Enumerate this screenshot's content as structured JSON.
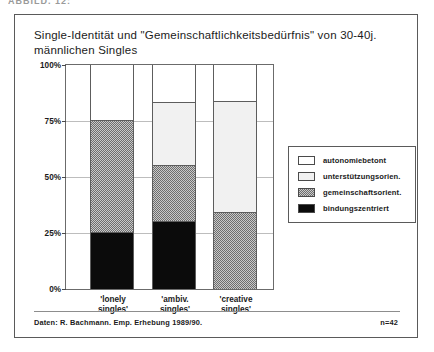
{
  "top_caption": "ABBILD. 12:",
  "figure": {
    "title": "Single-Identität und \"Gemeinschaftlichkeitsbedürfnis\"\nvon 30-40j. männlichen Singles",
    "source_note": "Daten: R. Bachmann. Emp. Erhebung 1989/90.",
    "n_note": "n=42"
  },
  "legend": {
    "items": [
      {
        "label": "autonomiebetont",
        "key": "autonomiebetont",
        "color": "#ffffff"
      },
      {
        "label": "unterstützungsorien.",
        "key": "unterstuetzung",
        "color": "#f1f1f1"
      },
      {
        "label": "gemeinschaftsorient.",
        "key": "gemeinschaft",
        "color": "#8f8f8f"
      },
      {
        "label": "bindungszentriert",
        "key": "bindung",
        "color": "#0b0b0b"
      }
    ]
  },
  "chart_data": {
    "type": "bar",
    "stacked": true,
    "title": "Single-Identität und \"Gemeinschaftlichkeitsbedürfnis\" von 30-40j. männlichen Singles",
    "xlabel": "",
    "ylabel": "",
    "ylim": [
      0,
      100
    ],
    "yticks": [
      0,
      25,
      50,
      75,
      100
    ],
    "ytick_labels": [
      "0%",
      "25%",
      "50%",
      "75%",
      "100%"
    ],
    "grid": true,
    "legend_position": "right",
    "units": "percent",
    "categories": [
      "'lonely\nsingles'",
      "'ambiv.\nsingles'",
      "'creative\nsingles'"
    ],
    "category_labels_flat": [
      "'lonely singles'",
      "'ambiv. singles'",
      "'creative singles'"
    ],
    "series": [
      {
        "name": "bindungszentriert",
        "key": "bindung",
        "color": "#0b0b0b",
        "values": [
          25,
          30,
          0
        ]
      },
      {
        "name": "gemeinschaftsorient.",
        "key": "gemeinschaft",
        "color": "#8f8f8f",
        "values": [
          50,
          25,
          34
        ]
      },
      {
        "name": "unterstützungsorien.",
        "key": "unterstuetzung",
        "color": "#f1f1f1",
        "values": [
          0,
          28,
          49.5
        ]
      },
      {
        "name": "autonomiebetont",
        "key": "autonomiebetont",
        "color": "#ffffff",
        "values": [
          25,
          17,
          16.5
        ]
      }
    ],
    "cumulative_tops": {
      "lonely": {
        "bindung": 25,
        "gemeinschaft": 75,
        "unterstuetzung": 75,
        "autonomiebetont": 100
      },
      "ambiv": {
        "bindung": 30,
        "gemeinschaft": 55,
        "unterstuetzung": 83,
        "autonomiebetont": 100
      },
      "creative": {
        "bindung": 0,
        "gemeinschaft": 34,
        "unterstuetzung": 83.5,
        "autonomiebetont": 100
      }
    }
  }
}
